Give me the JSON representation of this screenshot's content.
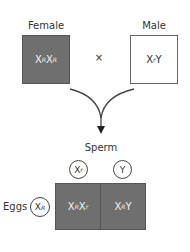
{
  "parents": {
    "female": {
      "label": "Female",
      "genotype_base1": "X",
      "allele1": "R",
      "genotype_base2": "X",
      "allele2": "R"
    },
    "cross_symbol": "×",
    "male": {
      "label": "Male",
      "genotype_base1": "X",
      "allele1": "r",
      "genotype_base2": "Y"
    }
  },
  "punnett": {
    "sperm_label": "Sperm",
    "eggs_label": "Eggs",
    "sperm": [
      {
        "base": "X",
        "allele": "r"
      },
      {
        "base": "Y",
        "allele": ""
      }
    ],
    "egg": {
      "base": "X",
      "allele": "R"
    },
    "cells": [
      {
        "b1": "X",
        "a1": "R",
        "b2": "X",
        "a2": "r"
      },
      {
        "b1": "X",
        "a1": "R",
        "b2": "Y",
        "a2": ""
      }
    ]
  },
  "colors": {
    "offspring_fill": "#6f6f6f",
    "female_fill": "#6f6f6f",
    "male_fill": "#ffffff"
  }
}
